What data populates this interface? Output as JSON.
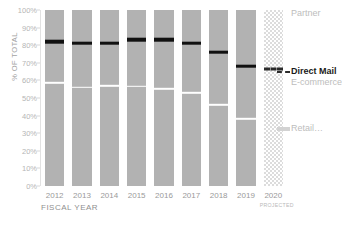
{
  "chart_data": {
    "type": "bar",
    "subtype": "100% stacked column",
    "title": "",
    "xlabel": "FISCAL YEAR",
    "ylabel": "% OF TOTAL",
    "ylim": [
      0,
      100
    ],
    "yunit": "%",
    "grid": false,
    "legend_position": "right",
    "categories": [
      "2012",
      "2013",
      "2014",
      "2015",
      "2016",
      "2017",
      "2018",
      "2019",
      "2020"
    ],
    "category_notes": [
      "",
      "",
      "",
      "",
      "",
      "",
      "",
      "",
      "PROJECTED"
    ],
    "ytick_labels": [
      "100%",
      "90%",
      "80%",
      "70%",
      "60%",
      "50%",
      "40%",
      "30%",
      "20%",
      "10%",
      "0%"
    ],
    "ytick_values": [
      100,
      90,
      80,
      70,
      60,
      50,
      40,
      30,
      20,
      10,
      0
    ],
    "series": [
      {
        "name": "Retail",
        "values": [
          59.5,
          57.0,
          58.0,
          57.5,
          56.0,
          54.0,
          47.0,
          39.0,
          null
        ]
      },
      {
        "name": "E-commerce",
        "values": [
          24.0,
          25.5,
          24.5,
          27.0,
          28.5,
          28.5,
          31.0,
          31.0,
          null
        ]
      },
      {
        "name": "Direct Mail",
        "values": [
          1.5,
          1.5,
          1.5,
          1.5,
          1.5,
          1.5,
          1.5,
          1.5,
          null
        ]
      },
      {
        "name": "Partner",
        "values": [
          15.0,
          16.0,
          16.0,
          14.0,
          14.0,
          16.0,
          20.5,
          28.5,
          null
        ]
      }
    ],
    "direct_mail_boundary": [
      84.0,
      83.0,
      83.0,
      85.0,
      85.0,
      83.0,
      78.0,
      70.0,
      68.0
    ],
    "ecommerce_retail_boundary": [
      59.5,
      57.0,
      58.0,
      57.5,
      56.0,
      54.0,
      47.0,
      39.0,
      null
    ],
    "annotations": [
      {
        "text": "PROJECTED",
        "target": "2020"
      }
    ]
  },
  "axes": {
    "y_title": "% OF TOTAL",
    "x_title": "FISCAL YEAR"
  },
  "legend": {
    "items": [
      {
        "label": "Partner",
        "emphasis": "normal",
        "marker": "none",
        "color": "#bdbdbd"
      },
      {
        "label": "Direct Mail",
        "emphasis": "bold",
        "marker": "dash",
        "color": "#1a1a1a"
      },
      {
        "label": "E-commerce",
        "emphasis": "normal",
        "marker": "none",
        "color": "#bdbdbd"
      },
      {
        "label": "Retail…",
        "emphasis": "normal",
        "marker": "hatch",
        "color": "#bdbdbd"
      }
    ]
  },
  "colors": {
    "bar_fill": "#b2b2b2",
    "separator": "#ffffff",
    "direct_mail": "#111111",
    "projected_hatch": "#dcdcdc",
    "tick_text": "#b5b5b5",
    "axis_text": "#9a9a9a"
  },
  "title_clip": ""
}
